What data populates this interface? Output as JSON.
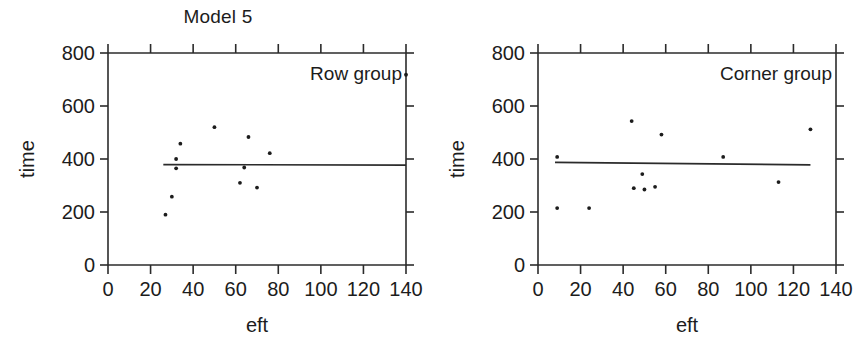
{
  "figure": {
    "title": "Model 5",
    "background_color": "#ffffff",
    "ink_color": "#1c1c1c",
    "panel_count": 2
  },
  "axis_titles": {
    "x": "eft",
    "y": "time"
  },
  "x_ticks": [
    "0",
    "20",
    "40",
    "60",
    "80",
    "100",
    "120",
    "140"
  ],
  "y_ticks": [
    "0",
    "200",
    "400",
    "600",
    "800"
  ],
  "panels": [
    {
      "tag": "Row group"
    },
    {
      "tag": "Corner group"
    }
  ],
  "chart_data": [
    {
      "type": "scatter",
      "title": "Model 5",
      "panel_label": "Row group",
      "xlabel": "eft",
      "ylabel": "time",
      "xlim": [
        0,
        140
      ],
      "ylim": [
        0,
        800
      ],
      "xticks": [
        0,
        20,
        40,
        60,
        80,
        100,
        120,
        140
      ],
      "yticks": [
        0,
        200,
        400,
        600,
        800
      ],
      "grid": false,
      "legend": "none",
      "marker": "small-filled-dot",
      "points": [
        {
          "x": 27,
          "y": 190
        },
        {
          "x": 30,
          "y": 258
        },
        {
          "x": 32,
          "y": 365
        },
        {
          "x": 32,
          "y": 400
        },
        {
          "x": 34,
          "y": 458
        },
        {
          "x": 50,
          "y": 520
        },
        {
          "x": 62,
          "y": 310
        },
        {
          "x": 64,
          "y": 368
        },
        {
          "x": 66,
          "y": 483
        },
        {
          "x": 70,
          "y": 292
        },
        {
          "x": 76,
          "y": 422
        },
        {
          "x": 140,
          "y": 718
        }
      ],
      "fit_line": {
        "name": "regression line",
        "x_start": 26,
        "y_start": 379,
        "x_end": 140,
        "y_end": 377
      }
    },
    {
      "type": "scatter",
      "title": "Model 5",
      "panel_label": "Corner group",
      "xlabel": "eft",
      "ylabel": "time",
      "xlim": [
        0,
        140
      ],
      "ylim": [
        0,
        800
      ],
      "xticks": [
        0,
        20,
        40,
        60,
        80,
        100,
        120,
        140
      ],
      "yticks": [
        0,
        200,
        400,
        600,
        800
      ],
      "grid": false,
      "legend": "none",
      "marker": "small-filled-dot",
      "points": [
        {
          "x": 9,
          "y": 408
        },
        {
          "x": 9,
          "y": 215
        },
        {
          "x": 24,
          "y": 215
        },
        {
          "x": 44,
          "y": 543
        },
        {
          "x": 45,
          "y": 290
        },
        {
          "x": 49,
          "y": 343
        },
        {
          "x": 50,
          "y": 285
        },
        {
          "x": 55,
          "y": 295
        },
        {
          "x": 58,
          "y": 492
        },
        {
          "x": 87,
          "y": 408
        },
        {
          "x": 113,
          "y": 313
        },
        {
          "x": 128,
          "y": 512
        }
      ],
      "fit_line": {
        "name": "regression line",
        "x_start": 8,
        "y_start": 387,
        "x_end": 128,
        "y_end": 378
      }
    }
  ]
}
